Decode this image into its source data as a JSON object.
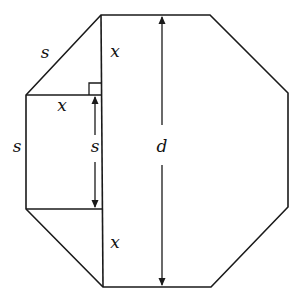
{
  "diagram": {
    "type": "regular-octagon-construction",
    "stroke_color": "#1a1a1a",
    "background": "#ffffff",
    "labels": {
      "slant_side": "s",
      "top_leg": "x",
      "horizontal_leg": "x",
      "left_side": "s",
      "inner_side": "s",
      "diameter": "d",
      "bottom_leg": "x"
    },
    "octagon_vertices": [
      [
        101,
        15
      ],
      [
        210,
        15
      ],
      [
        288,
        93
      ],
      [
        288,
        207
      ],
      [
        211,
        287
      ],
      [
        103,
        287
      ],
      [
        26,
        209
      ],
      [
        26,
        95
      ]
    ]
  }
}
